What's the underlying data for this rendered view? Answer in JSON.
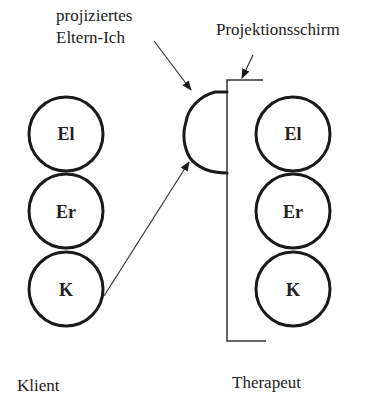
{
  "diagram": {
    "type": "transactional-analysis-projection",
    "labels": {
      "projected_parent_line1": "projiziertes",
      "projected_parent_line2": "Eltern-Ich",
      "screen": "Projektionsschirm",
      "client": "Klient",
      "therapist": "Therapeut"
    },
    "client_ego_states": [
      {
        "label": "El"
      },
      {
        "label": "Er"
      },
      {
        "label": "K"
      }
    ],
    "therapist_ego_states": [
      {
        "label": "El"
      },
      {
        "label": "Er"
      },
      {
        "label": "K"
      }
    ],
    "colors": {
      "stroke": "#1a1a1a",
      "text": "#222222",
      "background": "#ffffff"
    }
  }
}
